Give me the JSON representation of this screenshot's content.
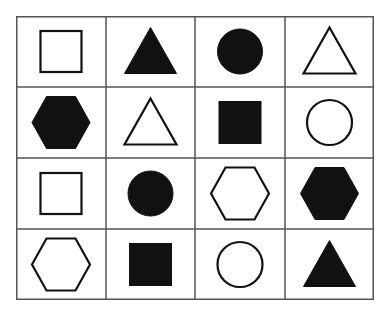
{
  "grid": {
    "rows": 4,
    "cols": 4,
    "line_color": "#555555",
    "shape_color": "#111111",
    "background": "#ffffff",
    "cells": [
      [
        {
          "shape": "square",
          "fill": "outline"
        },
        {
          "shape": "triangle",
          "fill": "filled"
        },
        {
          "shape": "circle",
          "fill": "filled"
        },
        {
          "shape": "triangle",
          "fill": "outline"
        }
      ],
      [
        {
          "shape": "hexagon",
          "fill": "filled"
        },
        {
          "shape": "triangle",
          "fill": "outline"
        },
        {
          "shape": "square",
          "fill": "filled"
        },
        {
          "shape": "circle",
          "fill": "outline"
        }
      ],
      [
        {
          "shape": "square",
          "fill": "outline"
        },
        {
          "shape": "circle",
          "fill": "filled"
        },
        {
          "shape": "hexagon",
          "fill": "outline"
        },
        {
          "shape": "hexagon",
          "fill": "filled"
        }
      ],
      [
        {
          "shape": "hexagon",
          "fill": "outline"
        },
        {
          "shape": "square",
          "fill": "filled"
        },
        {
          "shape": "circle",
          "fill": "outline"
        },
        {
          "shape": "triangle",
          "fill": "filled"
        }
      ]
    ]
  }
}
